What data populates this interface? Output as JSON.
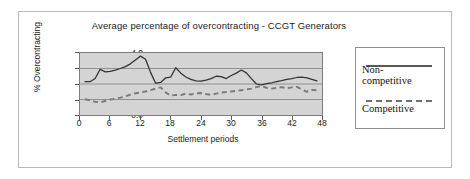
{
  "chart_data": {
    "type": "line",
    "title": "Average percentage of overcontracting - CCGT Generators",
    "xlabel": "Settlement periods",
    "ylabel": "% Overcontracting",
    "xlim": [
      0,
      48
    ],
    "ylim": [
      0,
      4
    ],
    "xticks": [
      0,
      6,
      12,
      18,
      24,
      30,
      36,
      42,
      48
    ],
    "yticks": [
      "0.0",
      "1.0",
      "2.0",
      "3.0",
      "4.0"
    ],
    "grid": "horizontal",
    "legend_position": "right",
    "plot_background": "#d4d4d4",
    "series": [
      {
        "name": "Non-competitive",
        "style": "solid",
        "color": "#333333",
        "x": [
          1,
          2,
          3,
          4,
          5,
          6,
          7,
          8,
          9,
          10,
          11,
          12,
          13,
          14,
          15,
          16,
          17,
          18,
          19,
          20,
          21,
          22,
          23,
          24,
          25,
          26,
          27,
          28,
          29,
          30,
          31,
          32,
          33,
          34,
          35,
          36,
          37,
          38,
          39,
          40,
          41,
          42,
          43,
          44,
          45,
          46,
          47
        ],
        "values": [
          2.15,
          2.15,
          2.35,
          2.95,
          2.78,
          2.82,
          2.9,
          3.0,
          3.12,
          3.3,
          3.55,
          3.8,
          3.6,
          2.75,
          2.05,
          2.1,
          2.4,
          2.45,
          3.05,
          2.7,
          2.45,
          2.3,
          2.2,
          2.18,
          2.25,
          2.35,
          2.5,
          2.48,
          2.35,
          2.55,
          2.7,
          2.9,
          2.72,
          2.35,
          2.0,
          1.95,
          2.02,
          2.08,
          2.15,
          2.22,
          2.3,
          2.35,
          2.42,
          2.45,
          2.4,
          2.3,
          2.2
        ]
      },
      {
        "name": "Competitive",
        "style": "dashed",
        "color": "#7a7a7a",
        "x": [
          1,
          2,
          3,
          4,
          5,
          6,
          7,
          8,
          9,
          10,
          11,
          12,
          13,
          14,
          15,
          16,
          17,
          18,
          19,
          20,
          21,
          22,
          23,
          24,
          25,
          26,
          27,
          28,
          29,
          30,
          31,
          32,
          33,
          34,
          35,
          36,
          37,
          38,
          39,
          40,
          41,
          42,
          43,
          44,
          45,
          46,
          47
        ],
        "values": [
          1.02,
          0.95,
          0.85,
          0.82,
          0.9,
          1.0,
          1.05,
          1.12,
          1.2,
          1.32,
          1.4,
          1.45,
          1.52,
          1.6,
          1.7,
          1.78,
          1.45,
          1.25,
          1.3,
          1.28,
          1.38,
          1.32,
          1.4,
          1.42,
          1.35,
          1.3,
          1.38,
          1.45,
          1.48,
          1.52,
          1.55,
          1.6,
          1.65,
          1.7,
          1.8,
          1.88,
          1.75,
          1.7,
          1.75,
          1.8,
          1.72,
          1.78,
          1.82,
          1.65,
          1.5,
          1.62,
          1.6
        ]
      }
    ]
  },
  "legend": {
    "non_competitive_label": "Non-\ncompetitive",
    "non_competitive_line1": "Non-",
    "non_competitive_line2": "competitive",
    "competitive_label": "Competitive"
  }
}
